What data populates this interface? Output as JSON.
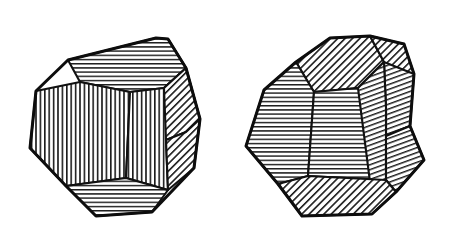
{
  "figure": {
    "caption": "",
    "background_color": "#ffffff",
    "line_color": "#111111",
    "hatch_color": "#1a1a1a",
    "width": 476,
    "height": 249,
    "object_count": 2
  },
  "objects": [
    {
      "name": "left-dodecahedron",
      "label": "",
      "center": [
        118,
        126
      ],
      "faces": [
        {
          "id": "left-face-top",
          "hatch": "horizontal",
          "points": "68,60 156,38 168,39 186,68 164,88 130,92 80,82"
        },
        {
          "id": "left-face-upper-right",
          "hatch": "diagonal-45",
          "points": "168,39 186,68 200,119 186,132 164,125 164,88 186,68"
        },
        {
          "id": "left-face-right-upper",
          "hatch": "diagonal-45",
          "points": "164,88 186,68 200,119 186,132 166,140 152,116"
        },
        {
          "id": "left-face-center-left",
          "hatch": "vertical",
          "points": "36,91 80,82 130,92 126,178 66,186 30,148"
        },
        {
          "id": "left-face-center-right",
          "hatch": "vertical",
          "points": "130,92 164,88 166,140 168,190 126,178"
        },
        {
          "id": "left-face-right-lower",
          "hatch": "diagonal-45",
          "points": "166,140 186,132 200,119 194,168 168,190"
        },
        {
          "id": "left-face-bottom",
          "hatch": "horizontal",
          "points": "66,186 126,178 168,190 152,212 96,216"
        }
      ],
      "outline": "68,60 156,38 168,39 186,68 200,119 194,168 152,212 96,216 66,186 30,148 36,91"
    },
    {
      "name": "right-dodecahedron",
      "label": "",
      "center": [
        352,
        126
      ],
      "faces": [
        {
          "id": "right-face-top",
          "hatch": "diagonal-45",
          "points": "296,62 330,38 370,36 384,62 358,88 314,92"
        },
        {
          "id": "right-face-top-right",
          "hatch": "diagonal-45",
          "points": "370,36 404,44 414,74 386,108 384,62"
        },
        {
          "id": "right-face-right-upper",
          "hatch": "diagonal-75",
          "points": "384,62 414,74 410,126 386,136 386,108"
        },
        {
          "id": "right-face-center-left",
          "hatch": "horizontal",
          "points": "264,90 296,62 314,92 308,176 278,184 246,146"
        },
        {
          "id": "right-face-center-right",
          "hatch": "horizontal",
          "points": "314,92 358,88 386,136 386,180 308,176"
        },
        {
          "id": "right-face-right-mid",
          "hatch": "diagonal-75",
          "points": "358,88 384,62 386,108 386,136 386,180 370,182"
        },
        {
          "id": "right-face-right-lower",
          "hatch": "diagonal-75",
          "points": "386,136 410,126 424,160 396,192 386,180"
        },
        {
          "id": "right-face-bottom",
          "hatch": "diagonal-45",
          "points": "278,184 308,176 386,180 396,192 372,214 302,216"
        }
      ],
      "outline": "296,62 330,38 370,36 404,44 414,74 410,126 424,160 396,192 372,214 302,216 278,184 246,146 264,90"
    }
  ]
}
